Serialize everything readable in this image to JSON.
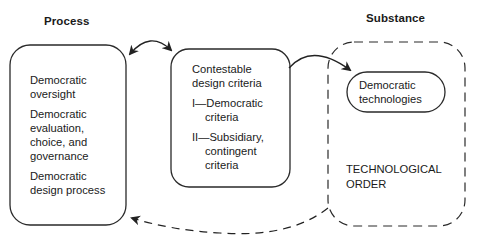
{
  "diagram": {
    "type": "conceptual-flow",
    "headings": {
      "process": "Process",
      "substance": "Substance"
    },
    "process_box": {
      "items": [
        {
          "line1": "Democratic",
          "line2": "oversight"
        },
        {
          "line1": "Democratic",
          "line2": "evaluation,",
          "line3": "choice, and",
          "line4": "governance"
        },
        {
          "line1": "Democratic",
          "line2": "design process"
        }
      ]
    },
    "criteria_box": {
      "title_line1": "Contestable",
      "title_line2": "design criteria",
      "criteria": [
        {
          "line1": "I—Democratic",
          "line2": "criteria"
        },
        {
          "line1": "II—Subsidiary,",
          "line2": "contingent",
          "line3": "criteria"
        }
      ]
    },
    "substance_box": {
      "pill_line1": "Democratic",
      "pill_line2": "technologies",
      "order_line1": "TECHNOLOGICAL",
      "order_line2": "ORDER"
    },
    "arrows": [
      {
        "from": "process_box",
        "to": "criteria_box",
        "style": "solid",
        "direction": "bidirectional"
      },
      {
        "from": "criteria_box",
        "to": "democratic_technologies",
        "style": "solid",
        "direction": "forward"
      },
      {
        "from": "substance_box",
        "to": "process_box",
        "style": "dashed",
        "direction": "forward"
      }
    ],
    "colors": {
      "stroke": "#2a2a2a",
      "text": "#1a1a1a",
      "background": "#ffffff"
    }
  }
}
